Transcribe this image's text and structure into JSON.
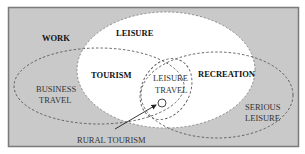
{
  "diagram": {
    "type": "venn",
    "colors": {
      "frame_fill": "#c9c9c9",
      "frame_border": "#7a7a7a",
      "leisure_fill": "#ffffff",
      "dash_stroke": "#555555",
      "text": "#111111"
    },
    "labels": {
      "work": "WORK",
      "leisure": "LEISURE",
      "tourism": "TOURISM",
      "recreation": "RECREATION",
      "leisure_travel_line1": "LEISURE",
      "leisure_travel_line2": "TRAVEL",
      "business_travel_line1": "BUSINESS",
      "business_travel_line2": "TRAVEL",
      "serious_leisure_line1": "SERIOUS",
      "serious_leisure_line2": "LEISURE",
      "rural_tourism": "RURAL TOURISM"
    }
  }
}
